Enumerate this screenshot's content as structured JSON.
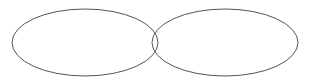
{
  "figure": {
    "name": "two-overlapping-ellipses",
    "background_color": "#ffffff",
    "width": 311,
    "height": 84,
    "stroke_color": "#555555",
    "stroke_width": 1,
    "fill": "none",
    "shapes": [
      {
        "id": "left-ellipse",
        "type": "ellipse",
        "cx": 85,
        "cy": 42.5,
        "rx": 73,
        "ry": 33.5,
        "stroke": "#555555",
        "stroke_width": 1,
        "fill": "none"
      },
      {
        "id": "right-ellipse",
        "type": "ellipse",
        "cx": 225,
        "cy": 42.5,
        "rx": 73,
        "ry": 33.5,
        "stroke": "#555555",
        "stroke_width": 1,
        "fill": "none"
      }
    ]
  }
}
